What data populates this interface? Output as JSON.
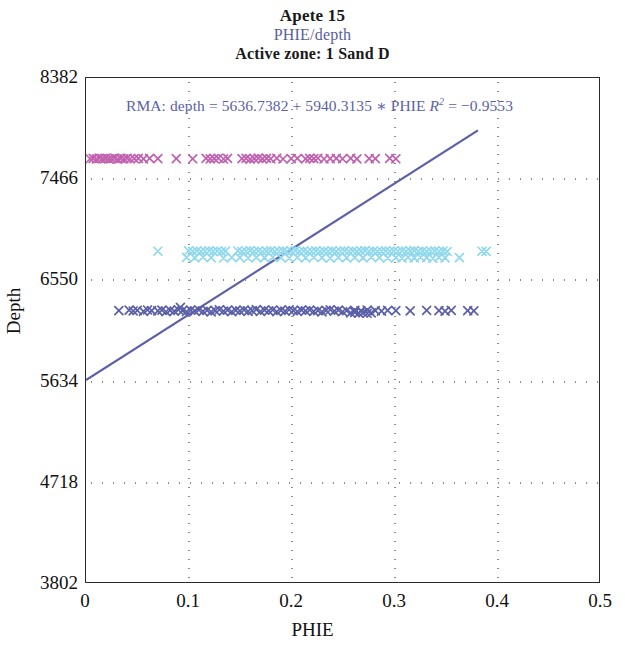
{
  "titles": {
    "main": "Apete 15",
    "sub": "PHIE/depth",
    "zone": "Active zone: 1 Sand D"
  },
  "annotation": {
    "prefix": "RMA: depth = 5636.7382 + 5940.3135 ",
    "operator": "∗",
    "variable": " PHIE ",
    "r_symbol": "R",
    "r_exp": "2",
    "r_equals": " = −0.9553",
    "full_text": "RMA: depth = 5636.7382 + 5940.3135 ∗ PHIE R² = −0.9553",
    "color": "#5b5fa8"
  },
  "chart_data": {
    "type": "scatter",
    "title": "Apete 15",
    "subtitle": "PHIE/depth",
    "xlabel": "PHIE",
    "ylabel": "Depth",
    "xlim": [
      0,
      0.5
    ],
    "ylim": [
      3802,
      8382
    ],
    "y_inverted": false,
    "grid": true,
    "legend": "none",
    "xticks": [
      "0",
      "0.1",
      "0.2",
      "0.3",
      "0.4",
      "0.5"
    ],
    "xtick_values": [
      0,
      0.1,
      0.2,
      0.3,
      0.4,
      0.5
    ],
    "yticks": [
      "8382",
      "7466",
      "6550",
      "5634",
      "4718",
      "3802"
    ],
    "ytick_values": [
      8382,
      7466,
      6550,
      5634,
      4718,
      3802
    ],
    "marker": "x",
    "regression": {
      "model": "RMA",
      "intercept": 5636.7382,
      "slope": 5940.3135,
      "r_squared": -0.9553,
      "x_start": 0.0,
      "x_end": 0.382,
      "y_start": 5636.7382,
      "y_end": 7906.0,
      "color": "#5b5fa8"
    },
    "series": [
      {
        "name": "upper-zone",
        "color": "#c060b0",
        "y_center": 7650,
        "points": [
          [
            0.004,
            7648
          ],
          [
            0.007,
            7651
          ],
          [
            0.01,
            7646
          ],
          [
            0.013,
            7653
          ],
          [
            0.016,
            7649
          ],
          [
            0.019,
            7652
          ],
          [
            0.022,
            7647
          ],
          [
            0.025,
            7650
          ],
          [
            0.028,
            7654
          ],
          [
            0.031,
            7645
          ],
          [
            0.034,
            7651
          ],
          [
            0.037,
            7648
          ],
          [
            0.04,
            7653
          ],
          [
            0.043,
            7646
          ],
          [
            0.047,
            7650
          ],
          [
            0.051,
            7652
          ],
          [
            0.056,
            7647
          ],
          [
            0.062,
            7651
          ],
          [
            0.07,
            7649
          ],
          [
            0.088,
            7650
          ],
          [
            0.104,
            7648
          ],
          [
            0.117,
            7652
          ],
          [
            0.121,
            7647
          ],
          [
            0.125,
            7650
          ],
          [
            0.129,
            7653
          ],
          [
            0.134,
            7646
          ],
          [
            0.138,
            7651
          ],
          [
            0.152,
            7649
          ],
          [
            0.156,
            7652
          ],
          [
            0.16,
            7645
          ],
          [
            0.164,
            7650
          ],
          [
            0.168,
            7654
          ],
          [
            0.172,
            7647
          ],
          [
            0.176,
            7651
          ],
          [
            0.18,
            7648
          ],
          [
            0.186,
            7653
          ],
          [
            0.192,
            7646
          ],
          [
            0.2,
            7650
          ],
          [
            0.206,
            7652
          ],
          [
            0.214,
            7647
          ],
          [
            0.218,
            7651
          ],
          [
            0.222,
            7649
          ],
          [
            0.226,
            7653
          ],
          [
            0.232,
            7646
          ],
          [
            0.238,
            7650
          ],
          [
            0.244,
            7652
          ],
          [
            0.25,
            7648
          ],
          [
            0.258,
            7651
          ],
          [
            0.264,
            7647
          ],
          [
            0.276,
            7650
          ],
          [
            0.282,
            7649
          ],
          [
            0.296,
            7651
          ],
          [
            0.302,
            7648
          ]
        ]
      },
      {
        "name": "middle-zone",
        "color": "#8fd8ee",
        "y_center": 6760,
        "points": [
          [
            0.07,
            6808
          ],
          [
            0.1,
            6812
          ],
          [
            0.104,
            6806
          ],
          [
            0.108,
            6810
          ],
          [
            0.112,
            6804
          ],
          [
            0.116,
            6808
          ],
          [
            0.12,
            6812
          ],
          [
            0.124,
            6806
          ],
          [
            0.128,
            6810
          ],
          [
            0.132,
            6805
          ],
          [
            0.136,
            6809
          ],
          [
            0.098,
            6752
          ],
          [
            0.106,
            6748
          ],
          [
            0.114,
            6754
          ],
          [
            0.122,
            6750
          ],
          [
            0.134,
            6746
          ],
          [
            0.142,
            6752
          ],
          [
            0.148,
            6810
          ],
          [
            0.152,
            6804
          ],
          [
            0.156,
            6808
          ],
          [
            0.16,
            6813
          ],
          [
            0.164,
            6806
          ],
          [
            0.168,
            6810
          ],
          [
            0.172,
            6803
          ],
          [
            0.176,
            6809
          ],
          [
            0.18,
            6812
          ],
          [
            0.184,
            6805
          ],
          [
            0.188,
            6808
          ],
          [
            0.192,
            6811
          ],
          [
            0.196,
            6804
          ],
          [
            0.2,
            6809
          ],
          [
            0.204,
            6813
          ],
          [
            0.208,
            6806
          ],
          [
            0.212,
            6810
          ],
          [
            0.216,
            6803
          ],
          [
            0.22,
            6808
          ],
          [
            0.224,
            6812
          ],
          [
            0.228,
            6805
          ],
          [
            0.232,
            6809
          ],
          [
            0.236,
            6806
          ],
          [
            0.24,
            6811
          ],
          [
            0.244,
            6804
          ],
          [
            0.248,
            6808
          ],
          [
            0.252,
            6812
          ],
          [
            0.256,
            6806
          ],
          [
            0.26,
            6810
          ],
          [
            0.264,
            6804
          ],
          [
            0.268,
            6809
          ],
          [
            0.272,
            6813
          ],
          [
            0.276,
            6806
          ],
          [
            0.28,
            6810
          ],
          [
            0.284,
            6805
          ],
          [
            0.288,
            6808
          ],
          [
            0.292,
            6812
          ],
          [
            0.296,
            6806
          ],
          [
            0.3,
            6810
          ],
          [
            0.15,
            6750
          ],
          [
            0.158,
            6746
          ],
          [
            0.166,
            6752
          ],
          [
            0.174,
            6748
          ],
          [
            0.182,
            6754
          ],
          [
            0.19,
            6750
          ],
          [
            0.198,
            6746
          ],
          [
            0.206,
            6752
          ],
          [
            0.214,
            6748
          ],
          [
            0.222,
            6753
          ],
          [
            0.23,
            6749
          ],
          [
            0.238,
            6745
          ],
          [
            0.246,
            6751
          ],
          [
            0.254,
            6747
          ],
          [
            0.262,
            6752
          ],
          [
            0.27,
            6748
          ],
          [
            0.278,
            6754
          ],
          [
            0.286,
            6750
          ],
          [
            0.294,
            6746
          ],
          [
            0.304,
            6808
          ],
          [
            0.308,
            6812
          ],
          [
            0.312,
            6805
          ],
          [
            0.316,
            6809
          ],
          [
            0.32,
            6813
          ],
          [
            0.324,
            6806
          ],
          [
            0.328,
            6810
          ],
          [
            0.332,
            6804
          ],
          [
            0.336,
            6808
          ],
          [
            0.34,
            6812
          ],
          [
            0.344,
            6806
          ],
          [
            0.348,
            6810
          ],
          [
            0.352,
            6805
          ],
          [
            0.302,
            6750
          ],
          [
            0.308,
            6746
          ],
          [
            0.314,
            6752
          ],
          [
            0.32,
            6748
          ],
          [
            0.326,
            6753
          ],
          [
            0.332,
            6749
          ],
          [
            0.338,
            6745
          ],
          [
            0.344,
            6751
          ],
          [
            0.35,
            6747
          ],
          [
            0.364,
            6750
          ],
          [
            0.386,
            6808
          ],
          [
            0.39,
            6806
          ]
        ]
      },
      {
        "name": "lower-zone",
        "color": "#5a5fa8",
        "y_center": 6270,
        "points": [
          [
            0.032,
            6268
          ],
          [
            0.042,
            6272
          ],
          [
            0.046,
            6265
          ],
          [
            0.05,
            6270
          ],
          [
            0.056,
            6262
          ],
          [
            0.06,
            6274
          ],
          [
            0.064,
            6268
          ],
          [
            0.07,
            6266
          ],
          [
            0.074,
            6272
          ],
          [
            0.078,
            6258
          ],
          [
            0.082,
            6270
          ],
          [
            0.086,
            6264
          ],
          [
            0.09,
            6276
          ],
          [
            0.092,
            6298
          ],
          [
            0.094,
            6268
          ],
          [
            0.098,
            6260
          ],
          [
            0.102,
            6272
          ],
          [
            0.106,
            6266
          ],
          [
            0.11,
            6274
          ],
          [
            0.114,
            6262
          ],
          [
            0.118,
            6270
          ],
          [
            0.122,
            6256
          ],
          [
            0.126,
            6268
          ],
          [
            0.13,
            6276
          ],
          [
            0.134,
            6264
          ],
          [
            0.138,
            6272
          ],
          [
            0.142,
            6258
          ],
          [
            0.146,
            6270
          ],
          [
            0.15,
            6266
          ],
          [
            0.154,
            6274
          ],
          [
            0.158,
            6262
          ],
          [
            0.162,
            6268
          ],
          [
            0.166,
            6278
          ],
          [
            0.17,
            6260
          ],
          [
            0.174,
            6272
          ],
          [
            0.178,
            6266
          ],
          [
            0.182,
            6274
          ],
          [
            0.186,
            6258
          ],
          [
            0.19,
            6270
          ],
          [
            0.194,
            6264
          ],
          [
            0.198,
            6276
          ],
          [
            0.202,
            6268
          ],
          [
            0.206,
            6260
          ],
          [
            0.21,
            6272
          ],
          [
            0.214,
            6266
          ],
          [
            0.218,
            6274
          ],
          [
            0.222,
            6262
          ],
          [
            0.226,
            6268
          ],
          [
            0.23,
            6256
          ],
          [
            0.234,
            6270
          ],
          [
            0.238,
            6276
          ],
          [
            0.242,
            6264
          ],
          [
            0.246,
            6272
          ],
          [
            0.25,
            6258
          ],
          [
            0.254,
            6268
          ],
          [
            0.258,
            6248
          ],
          [
            0.262,
            6252
          ],
          [
            0.266,
            6246
          ],
          [
            0.27,
            6250
          ],
          [
            0.274,
            6244
          ],
          [
            0.278,
            6248
          ],
          [
            0.262,
            6270
          ],
          [
            0.268,
            6266
          ],
          [
            0.274,
            6272
          ],
          [
            0.282,
            6268
          ],
          [
            0.288,
            6264
          ],
          [
            0.294,
            6270
          ],
          [
            0.302,
            6268
          ],
          [
            0.316,
            6266
          ],
          [
            0.332,
            6270
          ],
          [
            0.344,
            6268
          ],
          [
            0.35,
            6264
          ],
          [
            0.356,
            6270
          ],
          [
            0.372,
            6268
          ],
          [
            0.378,
            6266
          ]
        ]
      }
    ]
  },
  "frame": {
    "border_color": "#2b2b2b",
    "grid_color": "#8a8a8a",
    "background": "#ffffff"
  }
}
